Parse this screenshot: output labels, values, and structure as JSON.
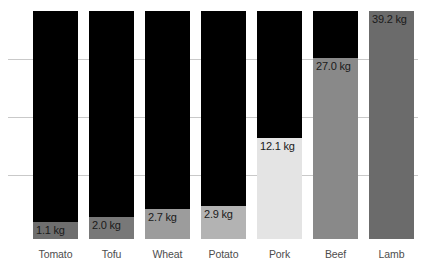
{
  "chart_data": {
    "type": "bar",
    "title": "",
    "subtitle": "",
    "xlabel": "",
    "ylabel": "",
    "categories": [
      "Tomato",
      "Tofu",
      "Wheat",
      "Potato",
      "Pork",
      "Beef",
      "Lamb"
    ],
    "values": [
      1.1,
      2.0,
      2.7,
      2.9,
      12.1,
      27.0,
      39.2
    ],
    "value_labels": [
      "1.1 kg",
      "2.0 kg",
      "2.7 kg",
      "2.9 kg",
      "12.1 kg",
      "27.0 kg",
      "39.2 kg"
    ],
    "unit": "kg",
    "ylim": [
      0,
      39.2
    ],
    "grid": true,
    "gridlines": [
      10,
      20,
      30
    ],
    "legend": "none",
    "bar_colors": [
      "#6e6e6e",
      "#787878",
      "#9c9c9c",
      "#b3b3b3",
      "#e4e4e4",
      "#898989",
      "#6b6b6b"
    ],
    "remainder_color": "#000000",
    "background_color": "#ffffff",
    "gridline_color": "#c9c9c9"
  },
  "bars": [
    {
      "category": "Tomato",
      "value_label": "1.1 kg",
      "value": 1.1,
      "fill_color": "#6e6e6e",
      "left": 33,
      "width": 45,
      "fill_height": 17,
      "total_height": 228
    },
    {
      "category": "Tofu",
      "value_label": "2.0 kg",
      "value": 2.0,
      "fill_color": "#787878",
      "left": 89,
      "width": 45,
      "fill_height": 22,
      "total_height": 228
    },
    {
      "category": "Wheat",
      "value_label": "2.7 kg",
      "value": 2.7,
      "fill_color": "#9c9c9c",
      "left": 145,
      "width": 45,
      "fill_height": 30,
      "total_height": 228
    },
    {
      "category": "Potato",
      "value_label": "2.9 kg",
      "value": 2.9,
      "fill_color": "#b3b3b3",
      "left": 201,
      "width": 45,
      "fill_height": 33,
      "total_height": 228
    },
    {
      "category": "Pork",
      "value_label": "12.1 kg",
      "value": 12.1,
      "fill_color": "#e4e4e4",
      "left": 257,
      "width": 45,
      "fill_height": 101,
      "total_height": 228
    },
    {
      "category": "Beef",
      "value_label": "27.0 kg",
      "value": 27.0,
      "fill_color": "#898989",
      "left": 313,
      "width": 45,
      "fill_height": 181,
      "total_height": 228
    },
    {
      "category": "Lamb",
      "value_label": "39.2 kg",
      "value": 39.2,
      "fill_color": "#6b6b6b",
      "left": 369,
      "width": 45,
      "fill_height": 228,
      "total_height": 228
    }
  ],
  "gridlines": [
    {
      "top": 59
    },
    {
      "top": 117
    },
    {
      "top": 175
    }
  ]
}
